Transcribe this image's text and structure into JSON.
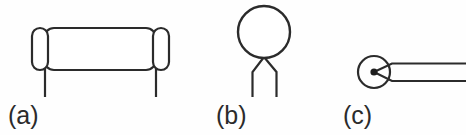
{
  "figure": {
    "background_color": "#fefefe",
    "stroke_color": "#2b2b2b",
    "fill_color": "#ffffff",
    "canvas": {
      "width": 466,
      "height": 135
    },
    "panels": [
      {
        "id": "panel-a",
        "label": "(a)",
        "icon_name": "capped-cylinder-with-legs-diagram",
        "description": "horizontal rounded body with two vertical capsule end caps and two downward legs",
        "geometry": {
          "body": {
            "x": 44,
            "y": 28,
            "width": 112,
            "height": 42,
            "radius": 10
          },
          "left_cap": {
            "cx": 40,
            "cy": 49,
            "rx": 8,
            "ry": 21
          },
          "right_cap": {
            "cx": 161,
            "cy": 49,
            "rx": 8,
            "ry": 21
          },
          "left_leg": {
            "x": 45,
            "y1": 70,
            "y2": 97
          },
          "right_leg": {
            "x": 156,
            "y1": 70,
            "y2": 97
          }
        }
      },
      {
        "id": "panel-b",
        "label": "(b)",
        "icon_name": "circle-with-splayed-legs-diagram",
        "description": "circle above a V-joint splitting into two vertical legs",
        "geometry": {
          "circle": {
            "cx": 264,
            "cy": 32,
            "r": 26
          },
          "joint": {
            "x": 264,
            "y": 58
          },
          "left_leg": {
            "x1": 264,
            "y1": 58,
            "x2": 253,
            "y2": 72,
            "x3": 253,
            "y3": 97
          },
          "right_leg": {
            "x1": 264,
            "y1": 58,
            "x2": 276,
            "y2": 72,
            "x3": 276,
            "y3": 97
          }
        }
      },
      {
        "id": "panel-c",
        "label": "(c)",
        "icon_name": "circle-with-center-dot-and-two-rays-diagram",
        "description": "circle with filled center dot and two diverging rays extending to the right edge",
        "geometry": {
          "circle": {
            "cx": 374,
            "cy": 72,
            "r": 16
          },
          "center_dot": {
            "cx": 374,
            "cy": 72,
            "r": 3.5
          },
          "upper_ray": {
            "x1": 374,
            "y1": 72,
            "x2": 392,
            "y2": 64,
            "x3": 466,
            "y3": 64
          },
          "lower_ray": {
            "x1": 374,
            "y1": 72,
            "x2": 392,
            "y2": 81,
            "x3": 466,
            "y3": 81
          }
        }
      }
    ]
  }
}
